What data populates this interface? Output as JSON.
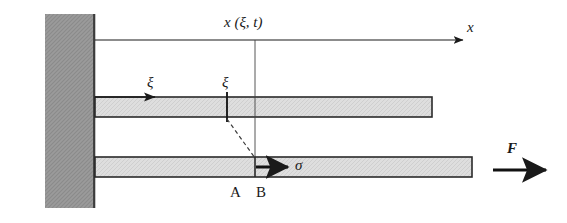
{
  "figure": {
    "type": "mechanics-diagram",
    "background_color": "#ffffff",
    "line_color": "#1a1a1a"
  },
  "wall": {
    "name": "rigid-wall",
    "fill_color": "#9a9a9a",
    "edge_color": "#3a3a3a",
    "x": 45,
    "y": 14,
    "width": 50,
    "height": 194
  },
  "bars": [
    {
      "name": "reference-bar",
      "fill_color": "#dcdcdc",
      "edge_color": "#2a2a2a",
      "x": 95,
      "y": 97,
      "width": 337,
      "height": 20
    },
    {
      "name": "deformed-bar",
      "fill_color": "#dcdcdc",
      "edge_color": "#2a2a2a",
      "x": 95,
      "y": 157,
      "width": 377,
      "height": 20
    }
  ],
  "axis": {
    "name": "x-axis",
    "label": "x",
    "start_x": 95,
    "end_x": 463,
    "y": 40,
    "label_x": 467,
    "label_y": 22
  },
  "labels": {
    "position_function": "x (ξ, t)",
    "material_coordinate": "ξ",
    "material_coordinate_second": "ξ",
    "stress": "σ",
    "force": "F",
    "point_a": "A",
    "point_b": "B"
  },
  "annotations": [
    {
      "name": "position-function-label",
      "text": "x (ξ, t)",
      "x": 224,
      "y": 16
    },
    {
      "name": "xi-arrow-label",
      "text": "ξ",
      "x": 147,
      "y": 77
    },
    {
      "name": "xi-tick-label",
      "text": "ξ",
      "x": 222,
      "y": 77
    },
    {
      "name": "stress-label",
      "text": "σ",
      "x": 293,
      "y": 157
    },
    {
      "name": "force-label",
      "text": "F",
      "x": 508,
      "y": 142
    },
    {
      "name": "point-a-label",
      "text": "A",
      "x": 230,
      "y": 187
    },
    {
      "name": "point-b-label",
      "text": "B",
      "x": 255,
      "y": 187
    }
  ],
  "arrows": [
    {
      "name": "xi-arrow",
      "from_x": 95,
      "to_x": 157,
      "y": 97,
      "style": "thin"
    },
    {
      "name": "stress-arrow",
      "from_x": 255,
      "to_x": 290,
      "y": 167,
      "style": "thick"
    },
    {
      "name": "force-arrow",
      "from_x": 493,
      "to_x": 548,
      "y": 170,
      "style": "thick"
    }
  ],
  "connectors": [
    {
      "name": "vertical-position-line",
      "x": 255,
      "from_y": 40,
      "to_y": 160,
      "style": "solid-thin"
    },
    {
      "name": "material-point-tick",
      "x": 227,
      "from_y": 93,
      "to_y": 123,
      "style": "solid-thick"
    },
    {
      "name": "displacement-dashed-line",
      "from_x": 227,
      "from_y": 120,
      "to_x": 255,
      "to_y": 158,
      "style": "dashed"
    }
  ]
}
